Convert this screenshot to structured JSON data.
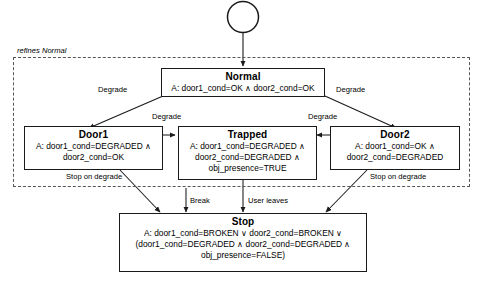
{
  "diagram": {
    "kind": "statechart",
    "region": {
      "label": "refines Normal",
      "style": "dashed"
    },
    "initial_state": {
      "name": "initial-pseudostate",
      "shape": "circle"
    },
    "states": [
      {
        "id": "normal",
        "title": "Normal",
        "body": "A: door1_cond=OK ∧ door2_cond=OK"
      },
      {
        "id": "door1",
        "title": "Door1",
        "body": "A: door1_cond=DEGRADED ∧\ndoor2_cond=OK"
      },
      {
        "id": "trapped",
        "title": "Trapped",
        "body": "A: door1_cond=DEGRADED ∧\ndoor2_cond=DEGRADED ∧\nobj_presence=TRUE"
      },
      {
        "id": "door2",
        "title": "Door2",
        "body": "A: door1_cond=OK ∧\ndoor2_cond=DEGRADED"
      },
      {
        "id": "stop",
        "title": "Stop",
        "body": "A: door1_cond=BROKEN ∨ door2_cond=BROKEN ∨\n(door1_cond=DEGRADED ∧ door2_cond=DEGRADED ∧\nobj_presence=FALSE)"
      }
    ],
    "transitions": [
      {
        "id": "t-normal-door1",
        "from": "normal",
        "to": "door1",
        "label": "Degrade"
      },
      {
        "id": "t-normal-door2",
        "from": "normal",
        "to": "door2",
        "label": "Degrade"
      },
      {
        "id": "t-door1-trapped",
        "from": "door1",
        "to": "trapped",
        "label": "Degrade"
      },
      {
        "id": "t-door2-trapped",
        "from": "door2",
        "to": "trapped",
        "label": "Degrade"
      },
      {
        "id": "t-door1-stop",
        "from": "door1",
        "to": "stop",
        "label": "Stop on degrade"
      },
      {
        "id": "t-door2-stop",
        "from": "door2",
        "to": "stop",
        "label": "Stop on degrade"
      },
      {
        "id": "t-region-stop",
        "from": "region",
        "to": "stop",
        "label": "Break"
      },
      {
        "id": "t-trapped-stop",
        "from": "trapped",
        "to": "stop",
        "label": "User leaves"
      }
    ],
    "colors": {
      "stroke": "#1a1a1a",
      "region_stroke": "#555555",
      "text": "#000000",
      "background": "#ffffff"
    }
  }
}
